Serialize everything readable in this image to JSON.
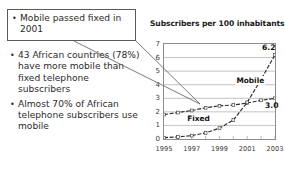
{
  "bullets": {
    "callout": {
      "marker": "•",
      "text": "Mobile passed fixed in 2001"
    },
    "items": [
      {
        "marker": "•",
        "text": "43 African countries (78%) have more mobile than fixed telephone subscribers"
      },
      {
        "marker": "•",
        "text": "Almost 70% of African telephone subscribers use mobile"
      }
    ]
  },
  "chart_data": {
    "type": "line",
    "title": "Subscribers per 100 inhabitants",
    "xlabel": "",
    "ylabel": "",
    "ylim": [
      0,
      7
    ],
    "yticks": [
      0,
      1,
      2,
      3,
      4,
      5,
      6,
      7
    ],
    "ytick_labels": [
      "0",
      "1",
      "2",
      "3",
      "4",
      "5",
      "6",
      "7"
    ],
    "grid": true,
    "legend": "inline-labels",
    "x": [
      1995,
      1996,
      1997,
      1998,
      1999,
      2000,
      2001,
      2002,
      2003
    ],
    "xtick_labels": [
      "1995",
      "1997",
      "1999",
      "2001",
      "2003"
    ],
    "xtick_values": [
      1995,
      1997,
      1999,
      2001,
      2003
    ],
    "series": [
      {
        "name": "Fixed",
        "values": [
          1.8,
          1.95,
          2.1,
          2.3,
          2.45,
          2.5,
          2.65,
          2.85,
          3.0
        ],
        "end_label": "3.0",
        "style": "dashed-with-markers"
      },
      {
        "name": "Mobile",
        "values": [
          0.1,
          0.15,
          0.25,
          0.45,
          0.8,
          1.4,
          2.7,
          4.4,
          6.2
        ],
        "end_label": "6.2",
        "style": "dashed-with-markers"
      }
    ],
    "annotations": [
      {
        "name": "crossover",
        "x": 2001,
        "y": 2.7,
        "note": "Mobile passes Fixed"
      }
    ],
    "colors": {
      "axis": "#8d8d8d",
      "grid": "#9a9a9a",
      "line": "#2e2e2e",
      "text": "#1a1a1a"
    }
  }
}
